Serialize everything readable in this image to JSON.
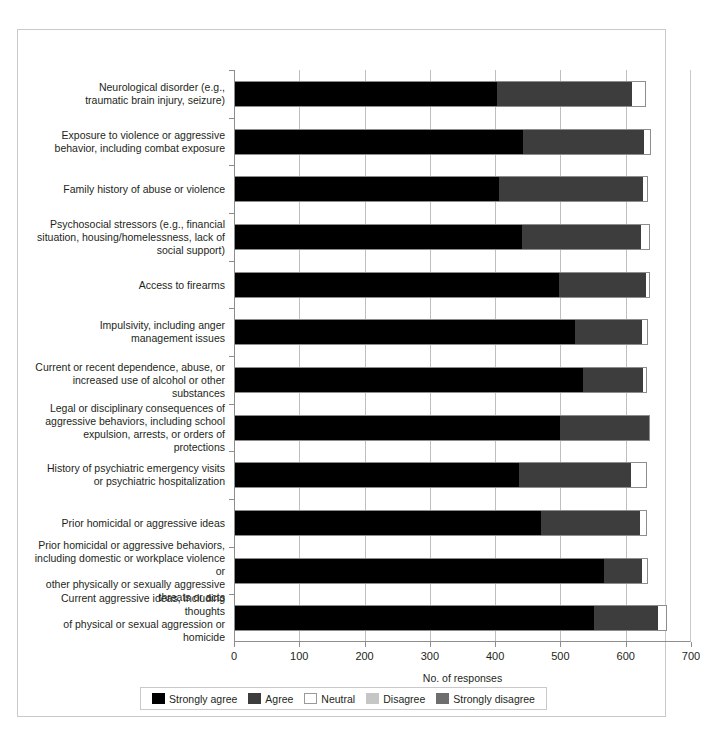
{
  "chart_data": {
    "type": "bar",
    "orientation": "horizontal",
    "stacked": true,
    "title": "",
    "xlabel": "No. of responses",
    "ylabel": "",
    "xlim": [
      0,
      700
    ],
    "xticks": [
      0,
      100,
      200,
      300,
      400,
      500,
      600,
      700
    ],
    "xtick_labels": [
      "0",
      "100",
      "200",
      "300",
      "400",
      "500",
      "600",
      "700"
    ],
    "grid": "vertical",
    "legend_position": "bottom",
    "categories": [
      "Neurological disorder (e.g., traumatic brain injury, seizure)",
      "Exposure to violence or aggressive behavior, including combat exposure",
      "Family history of abuse or violence",
      "Psychosocial stressors (e.g., financial situation, housing/homelessness, lack of social support)",
      "Access to firearms",
      "Impulsivity, including anger management issues",
      "Current or recent dependence, abuse, or increased use of alcohol or other substances",
      "Legal or disciplinary consequences of aggressive behaviors, including school expulsion, arrests, or orders of protections",
      "History of psychiatric emergency visits or psychiatric hospitalization",
      "Prior homicidal or aggressive ideas",
      "Prior homicidal or aggressive behaviors, including domestic or workplace violence or other physically or sexually aggressive threats or acts",
      "Current aggressive ideas, including thoughts of physical or sexual aggression or homicide"
    ],
    "category_lines": [
      [
        "Neurological disorder (e.g.,",
        "traumatic brain injury, seizure)"
      ],
      [
        "Exposure to violence or aggressive",
        "behavior, including combat exposure"
      ],
      [
        "Family history of abuse or violence"
      ],
      [
        "Psychosocial stressors (e.g., financial",
        "situation, housing/homelessness, lack of",
        "social support)"
      ],
      [
        "Access to firearms"
      ],
      [
        "Impulsivity, including anger",
        "management issues"
      ],
      [
        "Current or recent dependence, abuse, or",
        "increased use of alcohol or other substances"
      ],
      [
        "Legal or disciplinary consequences of",
        "aggressive behaviors, including school",
        "expulsion, arrests, or orders of protections"
      ],
      [
        "History of psychiatric emergency visits",
        "or psychiatric hospitalization"
      ],
      [
        "Prior homicidal or aggressive ideas"
      ],
      [
        "Prior homicidal or aggressive behaviors,",
        "including domestic or workplace violence or",
        "other physically or sexually aggressive",
        "threats or acts"
      ],
      [
        "Current aggressive ideas, including thoughts",
        "of physical or sexual aggression or homicide"
      ]
    ],
    "series": [
      {
        "name": "Strongly agree",
        "color": "#000000",
        "values": [
          403,
          442,
          406,
          441,
          498,
          523,
          534,
          499,
          436,
          470,
          566,
          551
        ]
      },
      {
        "name": "Agree",
        "color": "#3d3d3d",
        "values": [
          207,
          186,
          220,
          182,
          133,
          102,
          93,
          138,
          172,
          152,
          59,
          99
        ]
      },
      {
        "name": "Neutral",
        "color": "#ffffff",
        "values": [
          21,
          11,
          8,
          14,
          6,
          9,
          5,
          0,
          24,
          11,
          9,
          13
        ]
      },
      {
        "name": "Disagree",
        "color": "#c6c6c6",
        "values": [
          0,
          0,
          0,
          0,
          0,
          0,
          0,
          0,
          0,
          0,
          0,
          0
        ]
      },
      {
        "name": "Strongly disagree",
        "color": "#6e6e6e",
        "values": [
          0,
          0,
          0,
          0,
          0,
          0,
          0,
          0,
          0,
          0,
          0,
          0
        ]
      }
    ]
  },
  "axis": {
    "x_title": "No. of responses"
  },
  "legend": {
    "items": [
      {
        "label": "Strongly agree",
        "swatch": "sw-strongly-agree"
      },
      {
        "label": "Agree",
        "swatch": "sw-agree"
      },
      {
        "label": "Neutral",
        "swatch": "sw-neutral"
      },
      {
        "label": "Disagree",
        "swatch": "sw-disagree"
      },
      {
        "label": "Strongly disagree",
        "swatch": "sw-strongly-disagree"
      }
    ]
  }
}
